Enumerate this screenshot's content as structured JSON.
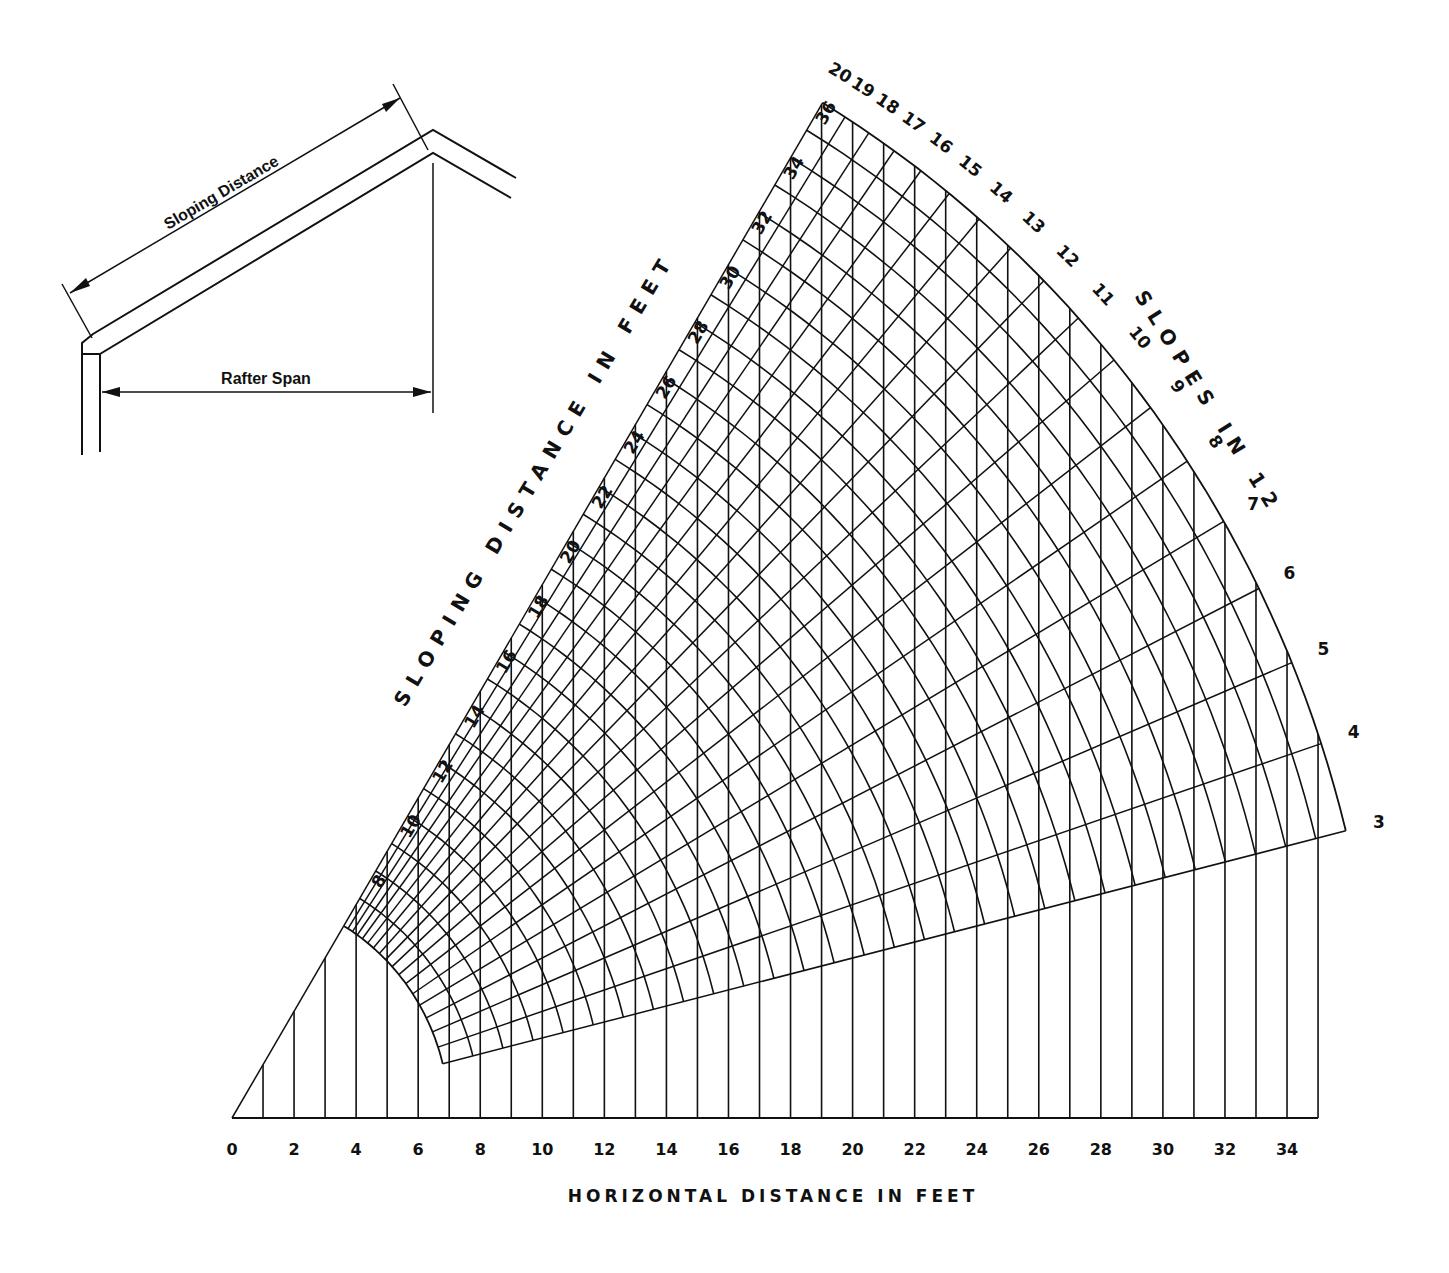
{
  "inset": {
    "sloping_distance_label": "Sloping Distance",
    "rafter_span_label": "Rafter Span"
  },
  "chart_data": {
    "type": "nomogram",
    "title": "",
    "xlabel": "HORIZONTAL DISTANCE IN FEET",
    "sloping_label": "SLOPING DISTANCE IN FEET",
    "slopes_label": "SLOPES IN 12",
    "x_ticks": [
      0,
      2,
      4,
      6,
      8,
      10,
      12,
      14,
      16,
      18,
      20,
      22,
      24,
      26,
      28,
      30,
      32,
      34
    ],
    "horizontal_lines_ft": {
      "from": 1,
      "to": 35,
      "step": 1
    },
    "sloping_distance_arcs_ft": {
      "from": 7,
      "to": 37,
      "step": 1
    },
    "sloping_distance_labels": [
      8,
      10,
      12,
      14,
      16,
      18,
      20,
      22,
      24,
      26,
      28,
      30,
      32,
      34,
      36
    ],
    "slope_rise_per_12": [
      3,
      4,
      5,
      6,
      7,
      8,
      9,
      10,
      11,
      12,
      13,
      14,
      15,
      16,
      17,
      18,
      19,
      20
    ],
    "geometry": {
      "origin_x": 232,
      "origin_y": 1118,
      "px_per_ft_x": 31.03,
      "px_per_ft_y": 32.0
    }
  }
}
